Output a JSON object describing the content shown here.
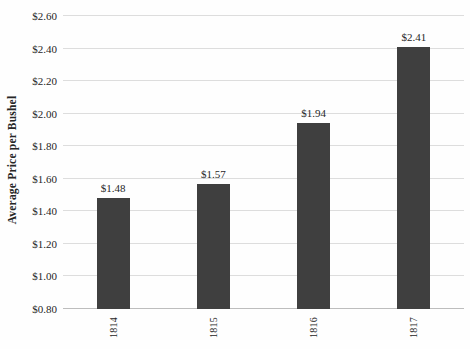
{
  "chart_data": {
    "type": "bar",
    "title": "",
    "xlabel": "",
    "ylabel": "Average Price per Bushel",
    "categories": [
      "1814",
      "1815",
      "1816",
      "1817"
    ],
    "values": [
      1.48,
      1.57,
      1.94,
      2.41
    ],
    "data_labels": [
      "$1.48",
      "$1.57",
      "$1.94",
      "$2.41"
    ],
    "ylim": [
      0.8,
      2.6
    ],
    "ytick_step": 0.2,
    "ytick_labels": [
      "$0.80",
      "$1.00",
      "$1.20",
      "$1.40",
      "$1.60",
      "$1.80",
      "$2.00",
      "$2.20",
      "$2.40",
      "$2.60"
    ],
    "grid": true,
    "legend": "none",
    "bar_width_px": 33,
    "colors": {
      "bar": "#3f3f3f",
      "gridline": "#dddddd",
      "axis_line": "#bdbdbd",
      "text": "#262626",
      "background": "#fefefe"
    }
  }
}
